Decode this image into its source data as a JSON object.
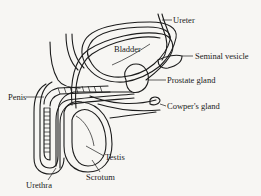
{
  "figure": {
    "type": "anatomical-diagram"
  },
  "labels": {
    "ureter": "Ureter",
    "bladder": "Bladder",
    "seminal_vesicle": "Seminal vesicle",
    "prostate_gland": "Prostate gland",
    "penis": "Penis",
    "cowpers_gland": "Cowper's gland",
    "testis": "Testis",
    "scrotum": "Scrotum",
    "urethra": "Urethra"
  },
  "colors": {
    "background": "#f7f6f3",
    "ink": "#1c1c1c"
  }
}
